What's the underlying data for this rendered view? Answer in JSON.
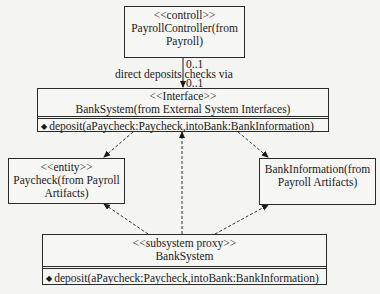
{
  "controller": {
    "stereotype": "<<controll>>",
    "name_line1": "PayrollController(from",
    "name_line2": "Payroll)"
  },
  "association": {
    "multiplicity_source": "0..1",
    "label": "direct deposits checks via",
    "multiplicity_target": "0..1"
  },
  "interface": {
    "stereotype": "<<Interface>>",
    "name": "BankSystem(from External System Interfaces)",
    "operation_icon": "operation-diamond-icon",
    "operation": "deposit(aPaycheck:Paycheck,intoBank:BankInformation)"
  },
  "paycheck": {
    "stereotype": "<<entity>>",
    "name_line1": "Paycheck(from Payroll",
    "name_line2": "Artifacts)"
  },
  "bank_information": {
    "name_line1": "BankInformation(from",
    "name_line2": "Payroll Artifacts)"
  },
  "proxy": {
    "stereotype": "<<subsystem proxy>>",
    "name": "BankSystem",
    "operation_icon": "operation-diamond-icon",
    "operation": "deposit(aPaycheck:Paycheck,intoBank:BankInformation)"
  }
}
